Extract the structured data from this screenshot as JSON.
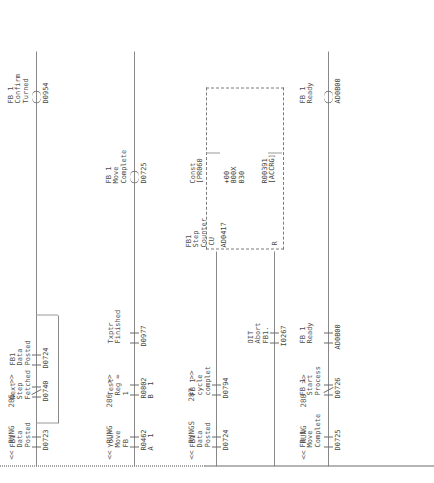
{
  "document": {
    "type": "plc-ladder-logic",
    "orientation": "landscape-rotated",
    "rung_numbers": [
      "285",
      "286",
      "287",
      "288"
    ],
    "rung_marker": "<<",
    "rung_marker_end": ">>",
    "rung_word": "RUNG",
    "rung_word_plural": "RUNGS"
  },
  "rungs": [
    {
      "number": "285",
      "marker_left": "<<",
      "marker_right": ">>",
      "label": "RUNG",
      "elements": [
        {
          "kind": "contact",
          "desc": "FB1\nData\nPosted",
          "address": "D0723",
          "glyph": "-] [-"
        },
        {
          "kind": "contact",
          "desc": "Next\nStep\nFetched",
          "address": "D0740",
          "glyph": "-]/[-"
        },
        {
          "kind": "branch_contact",
          "desc": "FB1\nData\nPosted",
          "address": "D0724",
          "glyph": "-] [-"
        },
        {
          "kind": "coil",
          "desc": "FB1\nData\nPosted",
          "address": "D0724",
          "glyph": "-( )-"
        },
        {
          "kind": "coil",
          "desc": "FB 1\nConfirm\nTurned",
          "address": "D0954",
          "glyph": "-]/[-"
        }
      ]
    },
    {
      "number": "286",
      "marker_left": "<<",
      "marker_right": ">>",
      "label": "RUNG",
      "elements": [
        {
          "kind": "contact",
          "desc": "Your\nMove\nFB",
          "address": "R0462\nA 1",
          "glyph": "-] [-"
        },
        {
          "kind": "contact",
          "desc": "Test\nReg =\n1",
          "address": "R0802\nB 1",
          "glyph": "-] [-"
        },
        {
          "kind": "contact",
          "desc": "Txptr\nFinished",
          "address": "D0977",
          "glyph": "-] [-"
        },
        {
          "kind": "coil",
          "desc": "FB 1\nMove\nComplete",
          "address": "D0725",
          "glyph": "-( )-"
        }
      ]
    },
    {
      "number": "287",
      "marker_left": "<<",
      "marker_right": ">>",
      "label": "RUNGS",
      "elements": [
        {
          "kind": "contact",
          "desc": "FB1\nData\nPosted",
          "address": "D0724",
          "glyph": "-] [-"
        },
        {
          "kind": "contact",
          "desc": "FB 1\ncycle\ncomplet",
          "address": "D0794",
          "glyph": "-] [-"
        },
        {
          "kind": "contact",
          "desc": "OIT\nAbort\nFB1",
          "address": "I0267",
          "glyph": "-] [-"
        },
        {
          "kind": "counter",
          "desc": "FB1\nStep\nCounter",
          "address": "AD0417",
          "cu": "CU",
          "r": "R",
          "preset_desc": "Const\n[PR060",
          "preset_addr": "+00\n800X\n030",
          "accum_desc": "R00391\n[ACCRG]"
        }
      ]
    },
    {
      "number": "288",
      "marker_left": "<<",
      "marker_right": ">>",
      "label": "RUNG",
      "elements": [
        {
          "kind": "contact",
          "desc": "FB 1\nMove\nComplete",
          "address": "D0725",
          "glyph": "-] [-"
        },
        {
          "kind": "contact",
          "desc": "FB 1\nStart\nProcess",
          "address": "D0726",
          "glyph": "-]/[-"
        },
        {
          "kind": "contact",
          "desc": "FB 1\nReady",
          "address": "AD0B00",
          "glyph": "-] [-"
        },
        {
          "kind": "coil",
          "desc": "FB 1\nReady",
          "address": "AD0B00",
          "glyph": "-( )-"
        }
      ]
    }
  ],
  "text": {
    "r285_num": "285",
    "r286_num": "286",
    "r287_num": "287",
    "r288_num": "288",
    "rung": "RUNG",
    "rungs": "RUNGS",
    "lt": "<<",
    "gt": ">>",
    "d0723": "D0723",
    "d0740": "D0740",
    "d0724": "D0724",
    "d0724b": "D0724",
    "d0954": "D0954",
    "d0725": "D0725",
    "d0725b": "D0725",
    "d0726": "D0726",
    "d0977": "D0977",
    "d0794": "D0794",
    "i0267": "I0267",
    "r0462": "R0462\nA  1",
    "r0802": "R0802\nB  1",
    "ad0417": "AD0417",
    "ad0b00": "AD0B00",
    "ad0b00b": "AD0B00",
    "r00391": "R00391\n[ACCRG]",
    "const_pr": "Const\n[PR060",
    "const_val": "+00\n800X\n030",
    "cu": "CU",
    "r_reset": "R",
    "desc_fb1_data_posted_a": "FB1\nData\nPosted",
    "desc_next_step_fetched": "Next\nStep\nFetched",
    "desc_fb1_data_posted_b": "FB1\nData\nPosted",
    "desc_fb1_data_posted_c": "FB1\nData\nPosted",
    "desc_fb1_confirm_turned": "FB 1\nConfirm\nTurned",
    "desc_your_move_fb": "Your\nMove\nFB",
    "desc_test_reg": "Test\nReg =\n1",
    "desc_txptr_finished": "Txptr\nFinished",
    "desc_fb1_move_complete": "FB 1\nMove\nComplete",
    "desc_fb1_data_posted_d": "FB1\nData\nPosted",
    "desc_fb1_cycle_complete": "FB 1\ncycle\ncomplet",
    "desc_oit_abort_fb1": "OIT\nAbort\nFB1.",
    "desc_fb1_step_counter": "FB1\nStep\nCounter",
    "desc_fb1_move_complete_b": "FB 1\nMove\nComplete",
    "desc_fb1_start_process": "FB 1\nStart\nProcess",
    "desc_fb1_ready": "FB 1\nReady",
    "desc_fb1_ready_b": "FB 1\nReady"
  },
  "colors": {
    "ink": "#4d4d4d",
    "line": "#8a8a8a",
    "rail": "#6d6d6d",
    "paper": "#ffffff"
  }
}
